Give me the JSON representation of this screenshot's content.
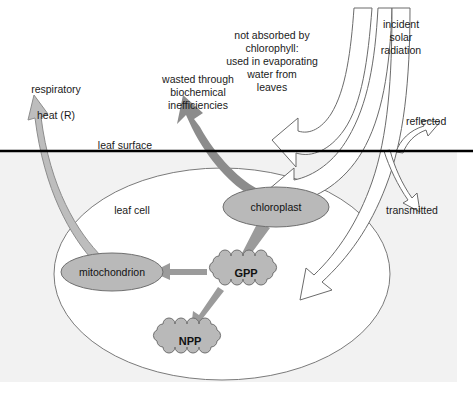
{
  "diagram": {
    "colors": {
      "shaded_background": "#f2f2f2",
      "shape_fill": "#b9b9b9",
      "shape_stroke": "#6f6f6f",
      "light_arrow_fill": "#bdbdbd",
      "light_arrow_stroke": "#8d8d8d",
      "dark_arrow_fill": "#8c8c8c",
      "mid_arrow_fill": "#9b9b9b",
      "white_arrow_fill": "#ffffff",
      "white_arrow_stroke": "#6b6b6b",
      "surface_line": "#000000",
      "cell_outline": "#777777",
      "text": "#1a1a1a"
    },
    "labels": {
      "respiratory_heat_line1": "respiratory",
      "respiratory_heat_line2_pre": "heat (",
      "respiratory_heat_r": "R",
      "respiratory_heat_line2_post": ")",
      "wasted": "wasted through\nbiochemical\ninefficiencies",
      "not_absorbed": "not absorbed by\nchlorophyll:\nused in evaporating\nwater from\nleaves",
      "incident_solar": "incident\nsolar\nradiation",
      "reflected": "reflected",
      "transmitted": "transmitted",
      "leaf_surface": "leaf surface",
      "leaf_cell": "leaf cell"
    },
    "shapes": {
      "chloroplast": "chloroplast",
      "mitochondrion": "mitochondrion",
      "gpp": "GPP",
      "npp": "NPP"
    },
    "flows": [
      {
        "from": "incident solar radiation",
        "to": "leaf / chloroplast",
        "style": "white-outline"
      },
      {
        "from": "incident solar radiation",
        "to": "not absorbed by chlorophyll",
        "style": "white-outline"
      },
      {
        "from": "incident solar radiation",
        "to": "reflected",
        "style": "white-outline-thin"
      },
      {
        "from": "incident solar radiation",
        "to": "transmitted",
        "style": "white-outline-thin"
      },
      {
        "from": "chloroplast",
        "to": "wasted through biochemical inefficiencies",
        "style": "dark-gray"
      },
      {
        "from": "chloroplast",
        "to": "GPP",
        "style": "mid-gray"
      },
      {
        "from": "GPP",
        "to": "mitochondrion",
        "style": "mid-gray"
      },
      {
        "from": "GPP",
        "to": "NPP",
        "style": "mid-gray"
      },
      {
        "from": "mitochondrion",
        "to": "respiratory heat (R)",
        "style": "light-gray"
      }
    ]
  }
}
